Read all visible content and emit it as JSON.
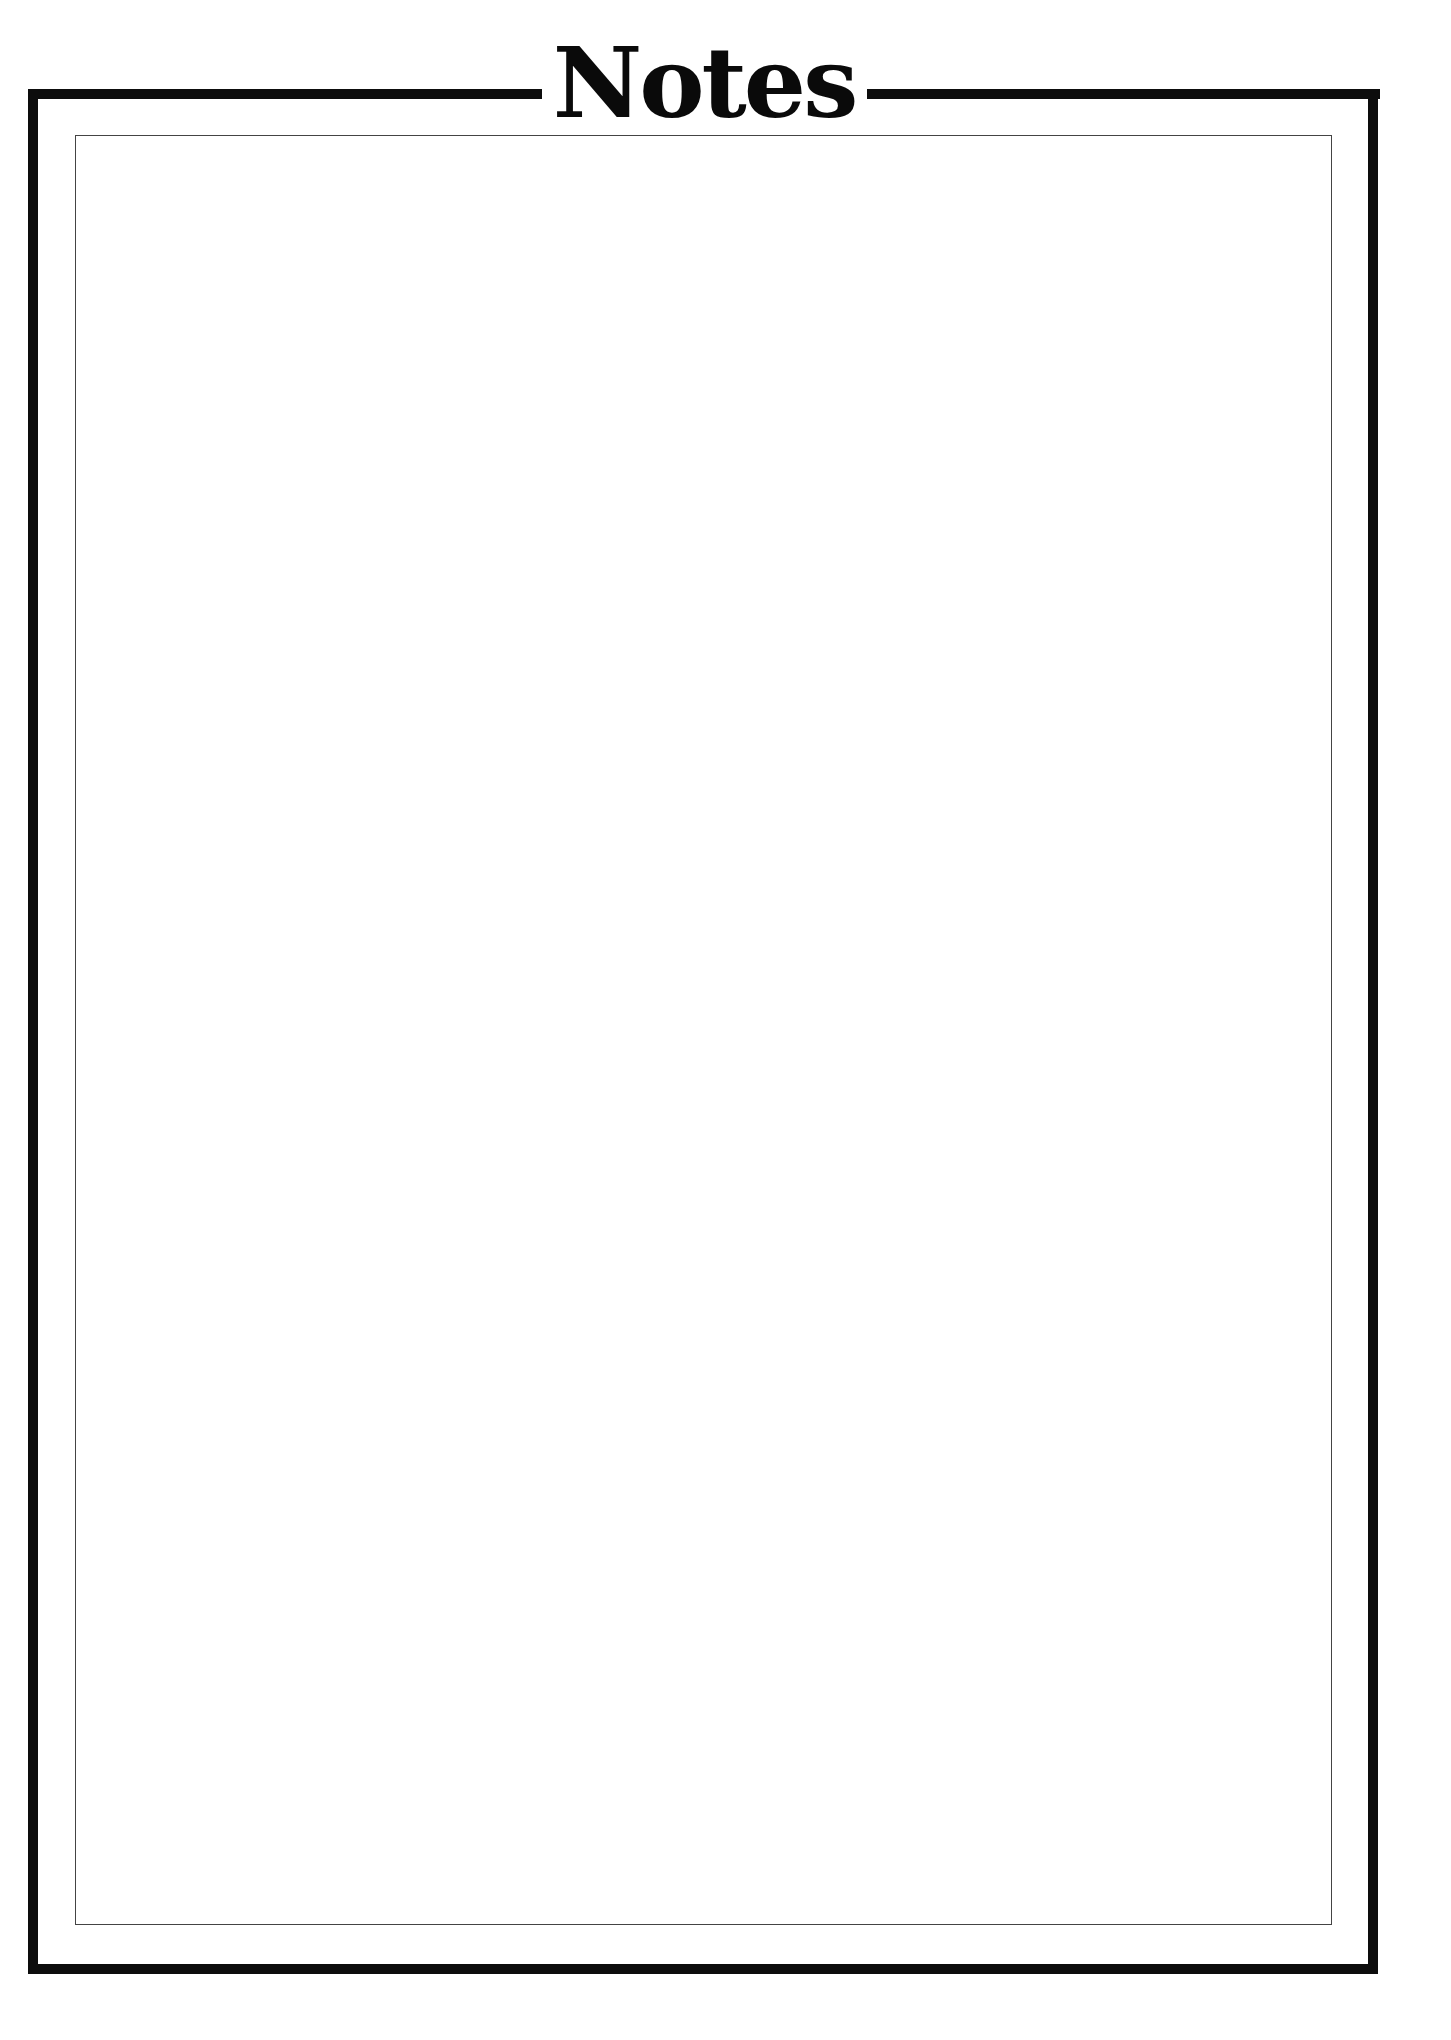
{
  "page": {
    "title": "Notes",
    "frame": {
      "outer_color": "#0d0d0d",
      "inner_color": "#444444",
      "background": "#ffffff"
    },
    "notes_area": {
      "content": ""
    }
  }
}
